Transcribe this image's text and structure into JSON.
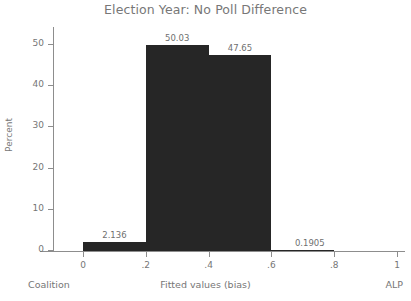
{
  "chart_data": {
    "type": "bar",
    "title": "Election Year: No Poll Difference",
    "xlabel": "Fitted values (bias)",
    "ylabel": "Percent",
    "xlim": [
      -0.21,
      1.12
    ],
    "ylim": [
      0,
      54
    ],
    "grid": false,
    "legend": null,
    "bin_width": 0.2,
    "categories": [
      "0 – .2",
      ".2 – .4",
      ".4 – .6",
      ".6 – .8"
    ],
    "bin_edges": [
      0,
      0.2,
      0.4,
      0.6,
      0.8
    ],
    "values": [
      2.136,
      50.03,
      47.65,
      0.1905
    ],
    "value_labels": [
      "2.136",
      "50.03",
      "47.65",
      "0.1905"
    ],
    "xticks": [
      "0",
      ".2",
      ".4",
      ".6",
      ".8",
      "1"
    ],
    "xtick_values": [
      0,
      0.2,
      0.4,
      0.6,
      0.8,
      1
    ],
    "yticks": [
      "0",
      "10",
      "20",
      "30",
      "40",
      "50"
    ],
    "ytick_values": [
      0,
      10,
      20,
      30,
      40,
      50
    ],
    "axis_captions": {
      "left": "Coalition",
      "center": "Fitted values (bias)",
      "right": "ALP"
    },
    "colors": {
      "bar_fill": "#262626",
      "axis": "#8d8d8d",
      "text": "#767676",
      "title": "#777777",
      "background": "#ffffff"
    }
  }
}
